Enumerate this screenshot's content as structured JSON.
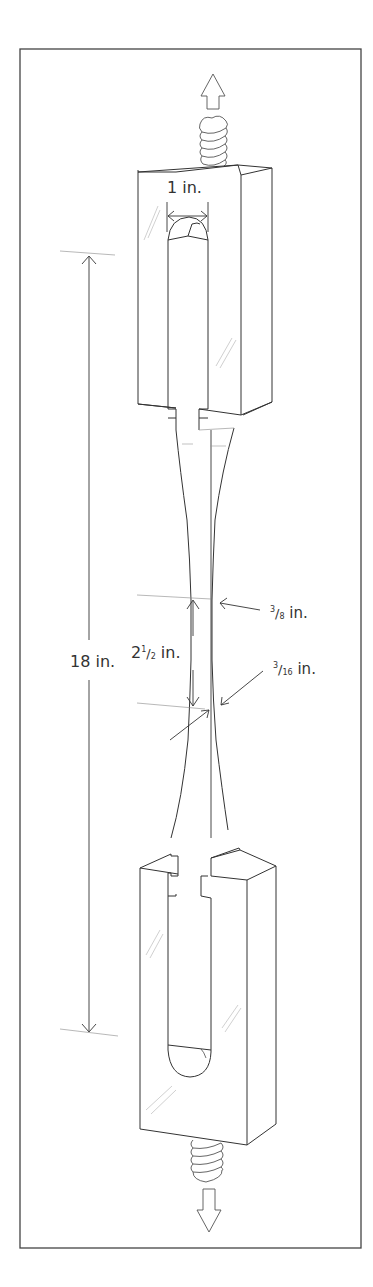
{
  "diagram": {
    "colors": {
      "line": "#333333",
      "thin_line": "#777777",
      "background": "#ffffff",
      "frame": "#444444"
    },
    "labels": {
      "grip_width": "1 in.",
      "overall_length": "18 in.",
      "gauge_length_whole": "2",
      "gauge_length_num": "1",
      "gauge_length_den": "2",
      "gauge_length_unit": "in.",
      "gauge_width_num": "3",
      "gauge_width_den": "8",
      "gauge_width_unit": "in.",
      "thickness_num": "3",
      "thickness_den": "16",
      "thickness_unit": "in."
    },
    "arrows": {
      "top": "pull-up-arrow",
      "bottom": "pull-down-arrow"
    }
  }
}
